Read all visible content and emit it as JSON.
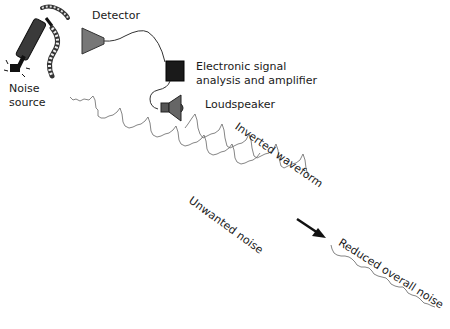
{
  "diagram": {
    "labels": {
      "noise_source_line1": "Noise",
      "noise_source_line2": "source",
      "detector": "Detector",
      "electronics_line1": "Electronic signal",
      "electronics_line2": "analysis and amplifier",
      "loudspeaker": "Loudspeaker",
      "inverted_waveform": "Inverted waveform",
      "unwanted_noise": "Unwanted noise",
      "reduced_noise": "Reduced overall noise"
    },
    "components": [
      {
        "id": "noise-source",
        "icon": "jackhammer-icon"
      },
      {
        "id": "detector",
        "icon": "microphone-cone-icon"
      },
      {
        "id": "electronics",
        "icon": "black-box-icon"
      },
      {
        "id": "loudspeaker",
        "icon": "speaker-icon"
      }
    ],
    "colors": {
      "line": "#333333",
      "wave": "#666666",
      "device_fill": "#6e6e6e",
      "box_fill": "#1a1a1a",
      "background": "#ffffff"
    }
  }
}
